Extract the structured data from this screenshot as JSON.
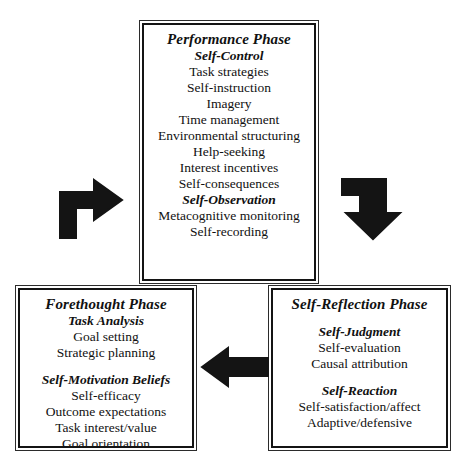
{
  "diagram": {
    "ink_color": "#141414",
    "background": "#ffffff"
  },
  "boxes": {
    "performance": {
      "title": "Performance Phase",
      "sections": [
        {
          "heading": "Self-Control",
          "items": [
            "Task strategies",
            "Self-instruction",
            "Imagery",
            "Time management",
            "Environmental structuring",
            "Help-seeking",
            "Interest incentives",
            "Self-consequences"
          ]
        },
        {
          "heading": "Self-Observation",
          "items": [
            "Metacognitive monitoring",
            "Self-recording"
          ]
        }
      ]
    },
    "forethought": {
      "title": "Forethought Phase",
      "sections": [
        {
          "heading": "Task Analysis",
          "items": [
            "Goal setting",
            "Strategic planning"
          ]
        },
        {
          "heading": "Self-Motivation Beliefs",
          "items": [
            "Self-efficacy",
            "Outcome expectations",
            "Task interest/value",
            "Goal orientation"
          ]
        }
      ]
    },
    "reflection": {
      "title": "Self-Reflection Phase",
      "sections": [
        {
          "heading": "Self-Judgment",
          "items": [
            "Self-evaluation",
            "Causal attribution"
          ]
        },
        {
          "heading": "Self-Reaction",
          "items": [
            "Self-satisfaction/affect",
            "Adaptive/defensive"
          ]
        }
      ]
    }
  },
  "arrows": [
    {
      "name": "forethought-to-performance",
      "direction": "up-then-right"
    },
    {
      "name": "performance-to-reflection",
      "direction": "right-then-down"
    },
    {
      "name": "reflection-to-forethought",
      "direction": "left"
    }
  ]
}
